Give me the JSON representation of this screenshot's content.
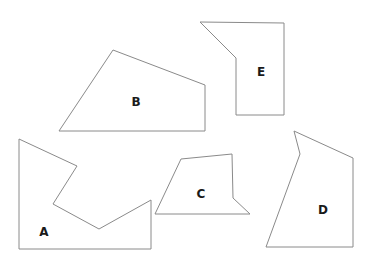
{
  "diagram": {
    "background": "#ffffff",
    "stroke_color": "#8a8a8a",
    "label_color": "#1a1a1a",
    "shapes": [
      {
        "id": "A",
        "label": "A",
        "points": "19,139 77,166 53,204 99,229 151,200 151,249 19,249",
        "label_pos": [
          44,
          232
        ]
      },
      {
        "id": "B",
        "label": "B",
        "points": "59,131 113,50 205,85 205,131",
        "label_pos": [
          136,
          102
        ]
      },
      {
        "id": "C",
        "label": "C",
        "points": "181,159 232,154 233,198 250,214 155,214",
        "label_pos": [
          201,
          194
        ]
      },
      {
        "id": "D",
        "label": "D",
        "points": "294,131 353,158 353,247 266,247 300,154",
        "label_pos": [
          323,
          210
        ]
      },
      {
        "id": "E",
        "label": "E",
        "points": "200,22 284,23 284,115 236,115 236,58",
        "label_pos": [
          261,
          72
        ]
      }
    ]
  }
}
